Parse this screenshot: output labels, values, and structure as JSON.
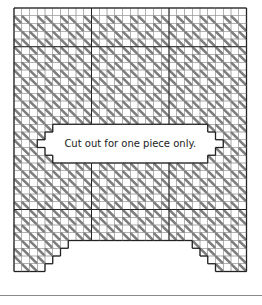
{
  "diagram": {
    "type": "needlepoint-chart",
    "label": "Cut out for one piece only.",
    "grid": {
      "cols": 30,
      "rows": 34,
      "origin_x": 14,
      "origin_y": 8,
      "cell": 7.75,
      "major_every": 10,
      "major_cols": [
        10,
        20
      ],
      "major_rows": [
        5,
        26
      ]
    },
    "colors": {
      "background": "#ffffff",
      "grid_line": "#9a9a9a",
      "major_line": "#222222",
      "border": "#222222",
      "stitch": "#7d7d7d",
      "rule": "#8a8a8a"
    },
    "cutout": {
      "label_cells": [
        5,
        15,
        25,
        20
      ],
      "steps_left": [
        [
          4,
          16,
          5,
          19
        ],
        [
          3,
          17,
          4,
          18
        ]
      ],
      "steps_right": [
        [
          25,
          16,
          26,
          19
        ],
        [
          26,
          17,
          27,
          18
        ]
      ]
    },
    "bottom_notch": {
      "top_row": 30,
      "col_start": 7,
      "col_end": 23,
      "step_rows": [
        [
          30,
          7,
          23
        ],
        [
          31,
          6,
          24
        ],
        [
          32,
          5,
          25
        ],
        [
          33,
          4,
          26
        ]
      ]
    }
  }
}
